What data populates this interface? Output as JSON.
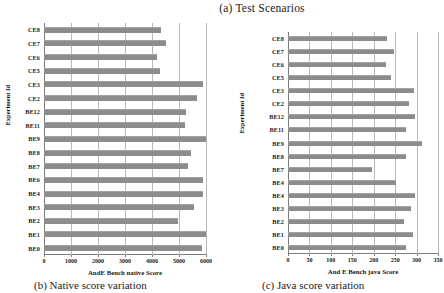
{
  "figure": {
    "title": "(a) Test Scenarios",
    "caption_native": "(b) Native score variation",
    "caption_java": "(c) Java score variation"
  },
  "chart_data": [
    {
      "type": "bar",
      "orientation": "horizontal",
      "id": "native",
      "title": "(b) Native score variation",
      "xlabel": "AndE Bench  native Score",
      "ylabel": "Experiment Id",
      "xlim": [
        0,
        6000
      ],
      "xticks": [
        0,
        1000,
        2000,
        3000,
        4000,
        5000,
        6000
      ],
      "xtick_labels": [
        "0",
        "1000",
        "2000",
        "3000",
        "4000",
        "5000",
        "6000"
      ],
      "grid": true,
      "legend": "none",
      "bar_color": "#8c8c8c",
      "categories": [
        "CE8",
        "CE7",
        "CE6",
        "CE5",
        "CE3",
        "CE2",
        "BE12",
        "BE11",
        "BE9",
        "BE8",
        "BE7",
        "BE6",
        "BE4",
        "BE3",
        "BE2",
        "BE1",
        "BE0"
      ],
      "values": [
        4350,
        4500,
        4200,
        4300,
        5880,
        5650,
        5250,
        5220,
        6150,
        5450,
        5350,
        5880,
        5880,
        5550,
        4980,
        6050,
        5850
      ]
    },
    {
      "type": "bar",
      "orientation": "horizontal",
      "id": "java",
      "title": "(c) Java score variation",
      "xlabel": "And E Bench  java Score",
      "ylabel": "Experiment Id",
      "xlim": [
        0,
        350
      ],
      "xticks": [
        0,
        50,
        100,
        150,
        200,
        250,
        300,
        350
      ],
      "xtick_labels": [
        "0",
        "50",
        "100",
        "150",
        "200",
        "250",
        "300",
        "350"
      ],
      "grid": true,
      "legend": "none",
      "bar_color": "#8c8c8c",
      "categories": [
        "CE8",
        "CE7",
        "CE6",
        "CE5",
        "CE3",
        "CE2",
        "BE12",
        "BE11",
        "BE9",
        "BE8",
        "BE7",
        "BE4",
        "BE4",
        "BE3",
        "BE2",
        "BE1",
        "BE0"
      ],
      "values": [
        230,
        248,
        228,
        240,
        293,
        283,
        297,
        276,
        312,
        276,
        197,
        252,
        296,
        288,
        271,
        291,
        275
      ]
    }
  ]
}
